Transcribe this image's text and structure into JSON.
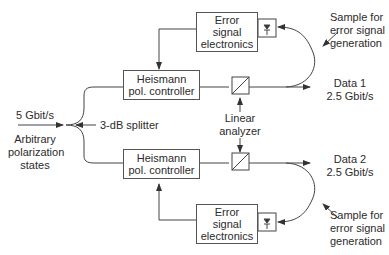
{
  "input": {
    "bitrate": "5 Gbit/s",
    "description_lines": [
      "Arbitrary",
      "polarization",
      "states"
    ]
  },
  "splitter": {
    "label": "3-dB splitter"
  },
  "upper_branch": {
    "controller": {
      "line1": "Heismann",
      "line2": "pol. controller"
    },
    "electronics": {
      "line1": "Error",
      "line2": "signal",
      "line3": "electronics"
    },
    "output": {
      "line1": "Data 1",
      "line2": "2.5 Gbit/s"
    },
    "sample": {
      "line1": "Sample for",
      "line2": "error signal",
      "line3": "generation"
    }
  },
  "lower_branch": {
    "controller": {
      "line1": "Heismann",
      "line2": "pol. controller"
    },
    "electronics": {
      "line1": "Error",
      "line2": "signal",
      "line3": "electronics"
    },
    "output": {
      "line1": "Data 2",
      "line2": "2.5 Gbit/s"
    },
    "sample": {
      "line1": "Sample for",
      "line2": "error signal",
      "line3": "generation"
    }
  },
  "analyzer": {
    "line1": "Linear",
    "line2": "analyzer"
  },
  "colors": {
    "line": "#444444",
    "text": "#2b2b2b",
    "background": "#ffffff"
  }
}
